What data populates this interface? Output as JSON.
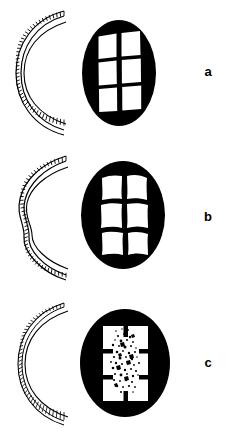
{
  "figure": {
    "type": "scientific-line-drawing",
    "background_color": "#ffffff",
    "ink_color": "#000000",
    "width": 234,
    "height": 437,
    "panel_count": 3
  },
  "panels": [
    {
      "id": "a",
      "label": "a",
      "arc": {
        "name": "intact-layered-arc",
        "state": "regular",
        "outer_band": "segmented-hatched-band",
        "inner_line": "smooth-thin-arc",
        "curvature": "smooth-circular",
        "segments": 46
      },
      "disc": {
        "name": "intact-compartment-disc",
        "fill": "#000000",
        "cell_fill": "#ffffff",
        "columns": 2,
        "rows": 3,
        "cell_count": 6,
        "cell_shape": "rectangular",
        "state": "intact",
        "center_texture": "none"
      }
    },
    {
      "id": "b",
      "label": "b",
      "arc": {
        "name": "buckled-layered-arc",
        "state": "undulating",
        "outer_band": "segmented-hatched-band",
        "inner_line": "wavy-thin-arc",
        "curvature": "buckled-wavy",
        "segments": 46
      },
      "disc": {
        "name": "distorted-compartment-disc",
        "fill": "#000000",
        "cell_fill": "#ffffff",
        "columns": 2,
        "rows": 3,
        "cell_count": 6,
        "cell_shape": "irregular-wavy",
        "state": "distorted",
        "center_texture": "none"
      }
    },
    {
      "id": "c",
      "label": "c",
      "arc": {
        "name": "degraded-layered-arc",
        "state": "fragmented",
        "outer_band": "thin-fragmented-band",
        "inner_line": "smooth-thin-arc",
        "curvature": "smooth-circular",
        "segments": 40
      },
      "disc": {
        "name": "degraded-compartment-disc",
        "fill": "#000000",
        "cell_fill": "#ffffff",
        "columns": 2,
        "rows": 3,
        "cell_count": 6,
        "cell_shape": "merged-open",
        "state": "degraded",
        "center_texture": "granular-speckled-mass"
      }
    }
  ]
}
